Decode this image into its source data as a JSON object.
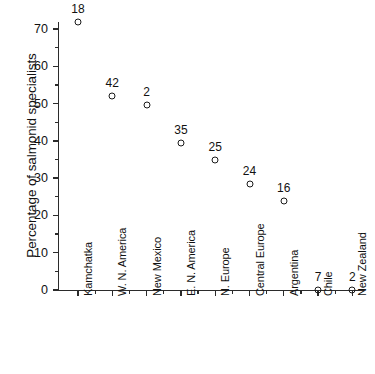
{
  "chart_data": {
    "type": "scatter",
    "title": "",
    "subtitle": "",
    "xlabel": "",
    "ylabel": "Percentage of salmonid specialists",
    "ylim": [
      0,
      72.5
    ],
    "y_ticks": [
      0,
      10,
      20,
      30,
      40,
      50,
      60,
      70
    ],
    "y_tick_labels": [
      "0",
      "10",
      "20",
      "30",
      "40",
      "50",
      "60",
      "70"
    ],
    "y_minor_ticks": [
      5,
      15,
      25,
      35,
      45,
      55,
      65
    ],
    "grid": false,
    "legend": "none",
    "categories": [
      "Kamchatka",
      "W. N. America",
      "New Mexico",
      "E. N. America",
      "N. Europe",
      "Central Europe",
      "Argentina",
      "Chile",
      "New Zealand"
    ],
    "values": [
      72,
      52,
      49.5,
      39.5,
      35,
      28.5,
      24,
      0,
      0
    ],
    "point_labels": [
      "18",
      "42",
      "2",
      "35",
      "25",
      "24",
      "16",
      "7",
      "2"
    ],
    "series": [
      {
        "name": "Percentage of salmonid specialists",
        "values": [
          72,
          52,
          49.5,
          39.5,
          35,
          28.5,
          24,
          0,
          0
        ],
        "annotations": [
          "18",
          "42",
          "2",
          "35",
          "25",
          "24",
          "16",
          "7",
          "2"
        ]
      }
    ],
    "marker": "open-circle",
    "marker_color": "#1a1a1a",
    "background_color": "#ffffff"
  }
}
